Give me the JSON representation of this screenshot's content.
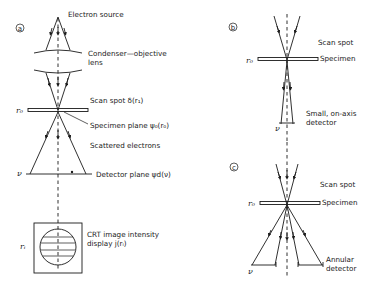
{
  "figure": {
    "panel_a": {
      "label": "a",
      "electron_source": "Electron source",
      "lens_line1": "Condenser—objective",
      "lens_line2": "lens",
      "scan_spot": "Scan spot δ(r₁)",
      "r0": "r₀",
      "specimen_plane": "Specimen plane ψ₀(r₀)",
      "scattered": "Scattered electrons",
      "nu": "ν",
      "detector_plane": "Detector plane ψd(ν)",
      "ri": "rᵢ",
      "crt_line1": "CRT image intensity",
      "crt_line2": "display j(rᵢ)"
    },
    "panel_b": {
      "label": "b",
      "scan_spot": "Scan spot",
      "r0": "r₀",
      "specimen": "Specimen",
      "detector_line1": "Small, on-axis",
      "detector_line2": "detector",
      "nu": "ν"
    },
    "panel_c": {
      "label": "c",
      "scan_spot": "Scan spot",
      "r0": "r₀",
      "specimen": "Specimen",
      "detector_line1": "Annular",
      "detector_line2": "detector",
      "nu": "ν"
    }
  }
}
